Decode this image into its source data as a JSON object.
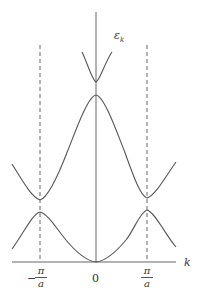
{
  "diagram": {
    "title": "",
    "y_axis_label": "ε",
    "y_axis_label_sub": "k",
    "x_axis_label": "k",
    "ticks": {
      "left": {
        "sign": "−",
        "numerator": "π",
        "denominator": "a"
      },
      "center": {
        "label": "0"
      },
      "right": {
        "numerator": "π",
        "denominator": "a"
      }
    },
    "colors": {
      "curve": "#555555",
      "axis": "#666666",
      "text": "#333333",
      "background": "#ffffff"
    }
  }
}
